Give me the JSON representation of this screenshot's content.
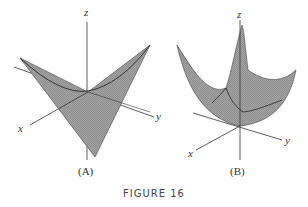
{
  "figure": {
    "title": "FIGURE 16",
    "panels": [
      {
        "id": "A",
        "caption": "(A)",
        "surface": "saddle",
        "axes": {
          "x": "x",
          "y": "y",
          "z": "z"
        }
      },
      {
        "id": "B",
        "caption": "(B)",
        "surface": "paraboloid",
        "axes": {
          "x": "x",
          "y": "y",
          "z": "z"
        }
      }
    ]
  },
  "colors": {
    "surface": "#9a9a9a",
    "mesh": "#6e6e6e",
    "axis": "#333333"
  }
}
